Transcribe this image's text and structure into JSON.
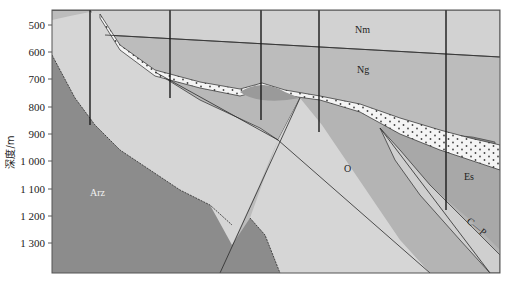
{
  "figure": {
    "type": "geological-cross-section",
    "y_axis": {
      "label": "深度/m",
      "ticks": [
        "500",
        "600",
        "700",
        "800",
        "900",
        "1 000",
        "1 100",
        "1 200",
        "1 300"
      ],
      "tick_values": [
        500,
        600,
        700,
        800,
        900,
        1000,
        1100,
        1200,
        1300
      ]
    },
    "units": {
      "nm": "Nm",
      "ng": "Ng",
      "o": "O",
      "es": "Es",
      "arz": "Arz",
      "cp": "C—P"
    },
    "wells": [
      {
        "x": 90,
        "top_depth": 455,
        "bottom_depth": 870
      },
      {
        "x": 170,
        "top_depth": 455,
        "bottom_depth": 770
      },
      {
        "x": 261,
        "top_depth": 455,
        "bottom_depth": 850
      },
      {
        "x": 319,
        "top_depth": 455,
        "bottom_depth": 890
      },
      {
        "x": 446,
        "top_depth": 455,
        "bottom_depth": 1175
      }
    ],
    "colors": {
      "background": "#ffffff",
      "frame": "#555555",
      "nm": "#d2d2d2",
      "ng": "#bcbcbc",
      "basement_light": "#d6d6d6",
      "o": "#b4b4b4",
      "arz": "#8c8c8c",
      "dark_lens": "#8e8e8e",
      "sand": "#f4f4f4",
      "line": "#2a2a2a"
    }
  }
}
